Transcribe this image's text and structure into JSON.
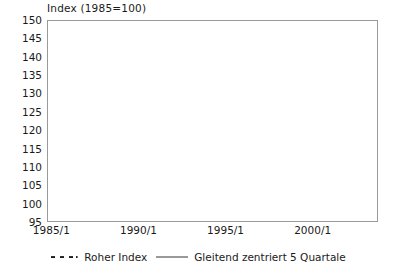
{
  "chart_data": {
    "type": "scatter",
    "title": "Index (1985=100)",
    "xlabel": "",
    "ylabel": "Index (1985=100)",
    "ylim": [
      95,
      150
    ],
    "ytick_step": 5,
    "yticks": [
      150,
      145,
      140,
      135,
      130,
      125,
      120,
      115,
      110,
      105,
      100,
      95
    ],
    "xticks": [
      "1985/1",
      "1990/1",
      "1995/1",
      "2000/1"
    ],
    "xtick_values": [
      1985.0,
      1990.0,
      1995.0,
      2000.0
    ],
    "xlim": [
      1984.75,
      2003.75
    ],
    "grid": true,
    "grid_axis": "y",
    "legend_position": "bottom",
    "x_unit": "quarter",
    "series": [
      {
        "name": "Roher Index",
        "style": "dotted-markers",
        "marker": "square",
        "color": "#1a1a1a",
        "x": [
          1985.0,
          1985.25,
          1985.5,
          1985.75,
          1986.0,
          1986.25,
          1986.5,
          1986.75,
          1987.0,
          1987.25,
          1987.5,
          1987.75,
          1988.0,
          1988.25,
          1988.5,
          1988.75,
          1989.0,
          1989.25,
          1989.5,
          1989.75,
          1990.0,
          1990.25,
          1990.5,
          1990.75,
          1991.0,
          1991.25,
          1991.5,
          1991.75,
          1992.0,
          1992.25,
          1992.5,
          1992.75,
          1993.0,
          1993.25,
          1993.5,
          1993.75,
          1994.0,
          1994.25,
          1994.5,
          1994.75,
          1995.0,
          1995.25,
          1995.5,
          1995.75,
          1996.0,
          1996.25,
          1996.5,
          1996.75,
          1997.0,
          1997.25,
          1997.5,
          1997.75,
          1998.0,
          1998.25,
          1998.5,
          1998.75,
          1999.0,
          1999.25,
          1999.5,
          1999.75,
          2000.0,
          2000.25,
          2000.5,
          2000.75,
          2001.0,
          2001.25,
          2001.5,
          2001.75,
          2002.0,
          2002.25,
          2002.5,
          2002.75,
          2003.0,
          2003.25,
          2003.5
        ],
        "values": [
          98.5,
          101.5,
          102.0,
          99.0,
          99.0,
          102.5,
          103.0,
          99.5,
          101.0,
          105.5,
          109.0,
          103.0,
          105.0,
          108.0,
          112.5,
          112.0,
          117.0,
          125.0,
          130.5,
          129.0,
          131.5,
          132.0,
          136.0,
          135.5,
          138.0,
          143.5,
          146.0,
          144.0,
          147.5,
          148.5,
          145.5,
          143.0,
          145.5,
          146.5,
          146.0,
          144.5,
          143.5,
          146.0,
          146.0,
          145.0,
          145.5,
          143.0,
          142.0,
          145.0,
          144.5,
          141.5,
          138.0,
          134.0,
          132.0,
          131.5,
          128.0,
          129.5,
          127.0,
          128.5,
          129.5,
          128.5,
          130.5,
          132.5,
          129.5,
          128.0,
          131.0,
          131.5,
          128.0,
          130.5,
          130.0,
          131.0,
          127.5,
          129.5,
          128.5,
          127.0,
          126.0,
          128.5,
          130.0,
          131.5,
          133.0
        ]
      },
      {
        "name": "Gleitend zentriert 5 Quartale",
        "style": "line",
        "color": "#6e6e6e",
        "x": [
          1985.5,
          1985.75,
          1986.0,
          1986.25,
          1986.5,
          1986.75,
          1987.0,
          1987.25,
          1987.5,
          1987.75,
          1988.0,
          1988.25,
          1988.5,
          1988.75,
          1989.0,
          1989.25,
          1989.5,
          1989.75,
          1990.0,
          1990.25,
          1990.5,
          1990.75,
          1991.0,
          1991.25,
          1991.5,
          1991.75,
          1992.0,
          1992.25,
          1992.5,
          1992.75,
          1993.0,
          1993.25,
          1993.5,
          1993.75,
          1994.0,
          1994.25,
          1994.5,
          1994.75,
          1995.0,
          1995.25,
          1995.5,
          1995.75,
          1996.0,
          1996.25,
          1996.5,
          1996.75,
          1997.0,
          1997.25,
          1997.5,
          1997.75,
          1998.0,
          1998.25,
          1998.5,
          1998.75,
          1999.0,
          1999.25,
          1999.5,
          1999.75,
          2000.0,
          2000.25,
          2000.5,
          2000.75,
          2001.0,
          2001.25,
          2001.5,
          2001.75,
          2002.0,
          2002.25,
          2002.5
        ],
        "values": [
          100.0,
          100.8,
          101.2,
          100.6,
          101.0,
          101.9,
          103.5,
          103.4,
          104.2,
          105.5,
          107.5,
          108.1,
          110.9,
          113.0,
          117.3,
          122.3,
          126.6,
          129.4,
          131.8,
          133.2,
          134.6,
          137.0,
          139.8,
          142.6,
          143.8,
          145.9,
          146.7,
          145.7,
          145.8,
          145.3,
          145.3,
          145.1,
          145.2,
          145.4,
          145.5,
          145.4,
          145.2,
          145.0,
          144.4,
          144.0,
          143.8,
          142.2,
          140.2,
          137.8,
          134.8,
          132.6,
          130.6,
          129.2,
          128.5,
          128.2,
          128.5,
          128.6,
          128.7,
          129.7,
          129.9,
          129.9,
          130.3,
          130.5,
          130.0,
          130.3,
          130.2,
          130.1,
          130.0,
          129.4,
          128.7,
          128.2,
          127.8,
          128.0,
          129.4
        ]
      }
    ]
  },
  "legend": {
    "entries": [
      {
        "label": "Roher Index",
        "marker": "dotted-square",
        "color": "#1a1a1a"
      },
      {
        "label": "Gleitend zentriert 5 Quartale",
        "marker": "solid-line",
        "color": "#6e6e6e"
      }
    ]
  },
  "colors": {
    "raw_series": "#1a1a1a",
    "smoothed_series": "#6e6e6e",
    "gridline": "#d5d5d5",
    "frame": "#9a9a9a",
    "background": "#ffffff",
    "text": "#1a1a1a"
  }
}
